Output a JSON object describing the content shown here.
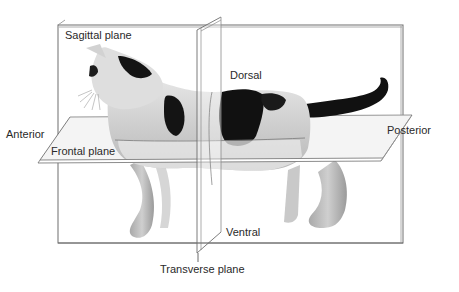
{
  "figure": {
    "labels": {
      "sagittal": "Sagittal plane",
      "dorsal": "Dorsal",
      "anterior": "Anterior",
      "posterior": "Posterior",
      "frontal": "Frontal plane",
      "ventral": "Ventral",
      "transverse": "Transverse plane"
    },
    "colors": {
      "plane_line": "#6e6e6e",
      "text": "#2a2a2a",
      "fur_light": "#d9d9d9",
      "fur_mid": "#bdbdbd",
      "fur_dark": "#141414",
      "frontal_fill": "#f1f1f1"
    }
  }
}
